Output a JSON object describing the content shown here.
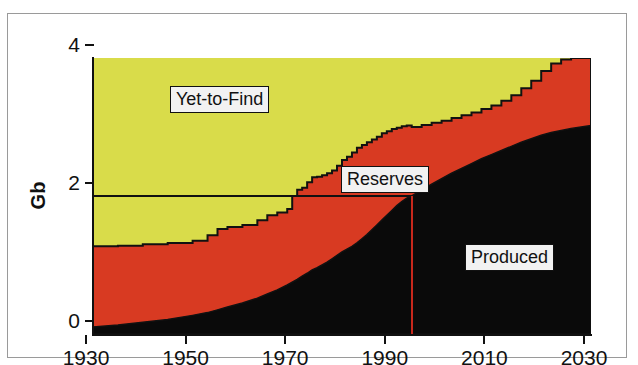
{
  "chart_data": {
    "type": "area",
    "title": "",
    "subtitle": "",
    "xlabel": "",
    "ylabel": "Gb",
    "xlim": [
      1930,
      2030
    ],
    "ylim": [
      0,
      4
    ],
    "grid": false,
    "legend_position": "inline-annotations",
    "stacked": true,
    "x_ticks": [
      1930,
      1950,
      1970,
      1990,
      2010,
      2030
    ],
    "x_tick_labels": [
      "1930",
      "1950",
      "1970",
      "1990",
      "2010",
      "2030"
    ],
    "y_ticks": [
      0,
      2,
      4
    ],
    "y_tick_labels": [
      "0",
      "2",
      "4"
    ],
    "colors": {
      "produced": "#0a0a0a",
      "reserves": "#d83a22",
      "yet_to_find": "#d9dc4a",
      "axis": "#111111",
      "marker_line": "#c8281c",
      "label_box_fill": "#f2f2f2",
      "frame": "#9a9a9a",
      "background": "#ffffff"
    },
    "annotations": [
      {
        "name": "yet-to-find",
        "text": "Yet-to-Find",
        "x": 1962,
        "y": 3.55
      },
      {
        "name": "reserves",
        "text": "Reserves",
        "x": 1980,
        "y": 2.35
      },
      {
        "name": "produced",
        "text": "Produced",
        "x": 2005,
        "y": 1.18
      }
    ],
    "reference_lines": [
      {
        "name": "two-gb-line",
        "orientation": "horizontal",
        "value": 2.0,
        "x_start": 1930,
        "x_end": 1994,
        "color": "#111111"
      },
      {
        "name": "current-year-line",
        "orientation": "vertical",
        "value": 1994,
        "y_start": 0,
        "y_end": 2.0,
        "color": "#c8281c"
      }
    ],
    "x": [
      1930,
      1935,
      1940,
      1945,
      1950,
      1953,
      1955,
      1957,
      1960,
      1963,
      1965,
      1967,
      1969,
      1970,
      1971,
      1972,
      1973,
      1974,
      1975,
      1976,
      1977,
      1978,
      1979,
      1980,
      1981,
      1982,
      1983,
      1984,
      1985,
      1986,
      1987,
      1988,
      1989,
      1990,
      1991,
      1992,
      1993,
      1994,
      1996,
      1998,
      2000,
      2002,
      2004,
      2006,
      2008,
      2010,
      2012,
      2014,
      2016,
      2018,
      2020,
      2022,
      2024,
      2026,
      2028,
      2030
    ],
    "series": [
      {
        "name": "Produced",
        "color": "#0a0a0a",
        "values": [
          0.1,
          0.13,
          0.17,
          0.21,
          0.27,
          0.31,
          0.35,
          0.39,
          0.45,
          0.52,
          0.58,
          0.64,
          0.71,
          0.75,
          0.79,
          0.84,
          0.88,
          0.93,
          0.96,
          1.0,
          1.04,
          1.09,
          1.14,
          1.19,
          1.23,
          1.27,
          1.32,
          1.38,
          1.44,
          1.51,
          1.58,
          1.65,
          1.72,
          1.79,
          1.86,
          1.92,
          1.97,
          2.0,
          2.09,
          2.17,
          2.25,
          2.33,
          2.4,
          2.47,
          2.54,
          2.6,
          2.66,
          2.72,
          2.78,
          2.83,
          2.88,
          2.92,
          2.95,
          2.98,
          3.0,
          3.02
        ]
      },
      {
        "name": "Reserves",
        "color": "#d83a22",
        "values": [
          1.17,
          1.15,
          1.13,
          1.11,
          1.08,
          1.12,
          1.17,
          1.16,
          1.13,
          1.13,
          1.14,
          1.12,
          1.1,
          1.25,
          1.3,
          1.28,
          1.32,
          1.34,
          1.32,
          1.3,
          1.29,
          1.28,
          1.3,
          1.33,
          1.34,
          1.36,
          1.38,
          1.36,
          1.34,
          1.31,
          1.28,
          1.26,
          1.22,
          1.18,
          1.13,
          1.09,
          1.05,
          1.0,
          0.94,
          0.89,
          0.84,
          0.8,
          0.77,
          0.74,
          0.72,
          0.71,
          0.72,
          0.74,
          0.78,
          0.84,
          0.93,
          1.0,
          1.03,
          1.04,
          1.04,
          1.04
        ]
      },
      {
        "name": "Yet-to-Find",
        "color": "#d9dc4a",
        "values": [
          2.73,
          2.72,
          2.7,
          2.68,
          2.65,
          2.57,
          2.48,
          2.45,
          2.42,
          2.35,
          2.28,
          2.24,
          2.19,
          2.0,
          1.91,
          1.88,
          1.8,
          1.73,
          1.72,
          1.7,
          1.67,
          1.63,
          1.56,
          1.48,
          1.43,
          1.37,
          1.3,
          1.26,
          1.22,
          1.18,
          1.14,
          1.09,
          1.06,
          1.03,
          1.01,
          0.99,
          0.98,
          1.0,
          0.97,
          0.94,
          0.91,
          0.87,
          0.83,
          0.79,
          0.74,
          0.69,
          0.62,
          0.54,
          0.44,
          0.33,
          0.19,
          0.08,
          0.02,
          0.0,
          0.0,
          0.0
        ]
      }
    ],
    "cumulative_top_of_reserves": [
      1.27,
      1.28,
      1.3,
      1.32,
      1.35,
      1.43,
      1.52,
      1.55,
      1.58,
      1.65,
      1.72,
      1.76,
      1.81,
      2.0,
      2.09,
      2.12,
      2.2,
      2.27,
      2.28,
      2.3,
      2.33,
      2.37,
      2.44,
      2.52,
      2.57,
      2.63,
      2.7,
      2.74,
      2.78,
      2.82,
      2.86,
      2.91,
      2.94,
      2.97,
      2.99,
      3.01,
      3.02,
      3.0,
      3.03,
      3.06,
      3.09,
      3.13,
      3.17,
      3.21,
      3.26,
      3.31,
      3.38,
      3.46,
      3.56,
      3.67,
      3.81,
      3.92,
      3.98,
      4.0,
      4.0,
      4.0
    ]
  },
  "axes": {
    "y_title": "Gb",
    "y_labels": [
      "4",
      "2",
      "0"
    ],
    "x_labels": [
      "1930",
      "1950",
      "1970",
      "1990",
      "2010",
      "2030"
    ]
  },
  "labels": {
    "yet_to_find": "Yet-to-Find",
    "reserves": "Reserves",
    "produced": "Produced"
  }
}
